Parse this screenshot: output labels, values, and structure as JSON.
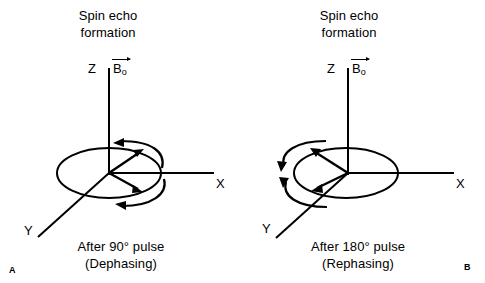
{
  "figure": {
    "domain": "diagram",
    "background_color": "#ffffff",
    "stroke_color": "#000000",
    "width": 485,
    "height": 283
  },
  "panels": [
    {
      "corner_label": "A",
      "title_line1": "Spin echo",
      "title_line2": "formation",
      "axes": {
        "z_label": "Z",
        "x_label": "X",
        "y_label": "Y"
      },
      "field_vector": {
        "symbol": "B",
        "subscript": "o",
        "accent": "arrow-overbar"
      },
      "caption_line1": "After 90° pulse",
      "caption_line2": "(Dephasing)",
      "magnetization_vectors": [
        {
          "name": "vector-up-right",
          "direction": "up-right"
        },
        {
          "name": "vector-down-right",
          "direction": "down-right"
        }
      ],
      "rotation_arcs": [
        {
          "name": "arc-upper",
          "side": "right",
          "arrowhead": "left"
        },
        {
          "name": "arc-lower",
          "side": "right",
          "arrowhead": "left"
        }
      ]
    },
    {
      "corner_label": "B",
      "title_line1": "Spin echo",
      "title_line2": "formation",
      "axes": {
        "z_label": "Z",
        "x_label": "X",
        "y_label": "Y"
      },
      "field_vector": {
        "symbol": "B",
        "subscript": "o",
        "accent": "arrow-overbar"
      },
      "caption_line1": "After 180° pulse",
      "caption_line2": "(Rephasing)",
      "magnetization_vectors": [
        {
          "name": "vector-up-left",
          "direction": "up-left"
        },
        {
          "name": "vector-down-left",
          "direction": "down-left"
        }
      ],
      "rotation_arcs": [
        {
          "name": "arc-upper",
          "side": "left",
          "arrowhead": "down-left"
        },
        {
          "name": "arc-lower",
          "side": "left",
          "arrowhead": "down-left"
        }
      ]
    }
  ]
}
